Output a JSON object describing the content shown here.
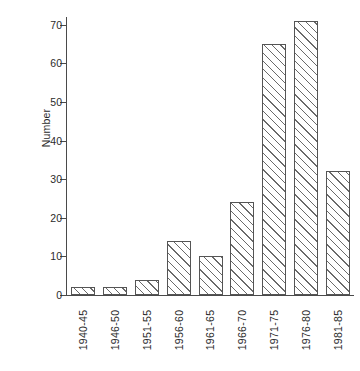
{
  "chart_data": {
    "type": "bar",
    "title": "",
    "subtitle": "",
    "xlabel": "",
    "ylabel": "Number",
    "categories": [
      "1940-45",
      "1946-50",
      "1951-55",
      "1956-60",
      "1961-65",
      "1966-70",
      "1971-75",
      "1976-80",
      "1981-85"
    ],
    "values": [
      2,
      2,
      4,
      14,
      10,
      24,
      65,
      71,
      32
    ],
    "ylim": [
      0,
      70
    ],
    "ymax_plot": 72,
    "yticks": [
      0,
      10,
      20,
      30,
      40,
      50,
      60,
      70
    ],
    "ytick_labels": [
      "0",
      "10",
      "20",
      "30",
      "40",
      "50",
      "60",
      "70"
    ],
    "grid": false,
    "legend": null,
    "legend_position": "none",
    "series": [
      {
        "name": "Number",
        "values": [
          2,
          2,
          4,
          14,
          10,
          24,
          65,
          71,
          32
        ]
      }
    ],
    "bar_style": {
      "fill": "#ffffff",
      "hatch": "diagonal-lines",
      "edge_color": "#555555"
    },
    "axis_color": "#4a4a4a",
    "text_color": "#2b2b2b",
    "background": "#ffffff"
  }
}
